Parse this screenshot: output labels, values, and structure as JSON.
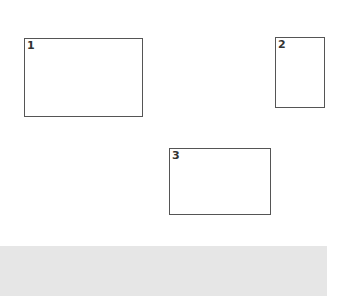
{
  "boxes": [
    {
      "label": "1",
      "x": 24,
      "y": 38,
      "w": 119,
      "h": 79
    },
    {
      "label": "2",
      "x": 275,
      "y": 37,
      "w": 50,
      "h": 71
    },
    {
      "label": "3",
      "x": 169,
      "y": 148,
      "w": 102,
      "h": 67
    }
  ],
  "colors": {
    "border": "#555555",
    "bar": "#e6e6e6"
  }
}
